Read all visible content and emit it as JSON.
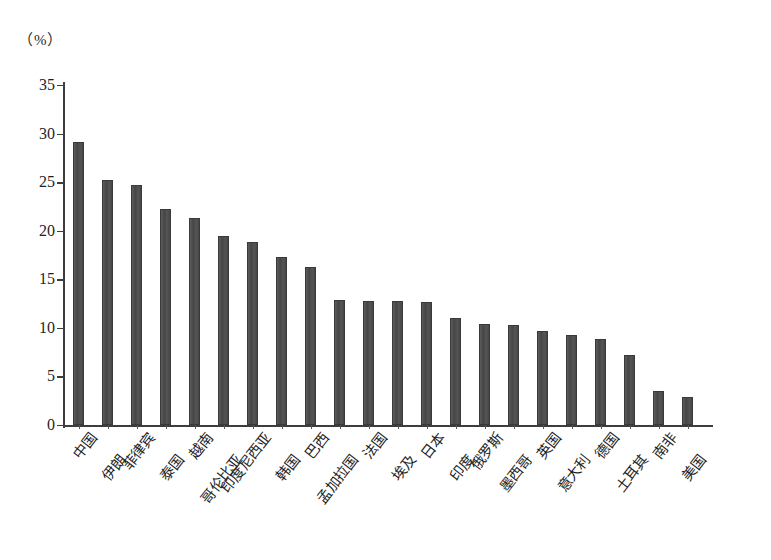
{
  "chart_data": {
    "type": "bar",
    "title": "",
    "subtitle": "",
    "unit_label": "（%）",
    "xlabel": "",
    "ylabel": "",
    "ylim": [
      0,
      35
    ],
    "y_ticks": [
      0,
      5,
      10,
      15,
      20,
      25,
      30,
      35
    ],
    "grid": false,
    "legend": false,
    "bar_color": "#4a4a4a",
    "axis_color": "#3d3d3d",
    "categories": [
      "中国",
      "伊朗",
      "菲律宾",
      "泰国",
      "越南",
      "哥伦比亚",
      "印度尼西亚",
      "韩国",
      "巴西",
      "孟加拉国",
      "法国",
      "埃及",
      "日本",
      "印度",
      "俄罗斯",
      "墨西哥",
      "英国",
      "意大利",
      "德国",
      "土耳其",
      "南非",
      "美国"
    ],
    "values": [
      29.1,
      25.2,
      24.7,
      22.2,
      21.3,
      19.5,
      18.8,
      17.3,
      16.3,
      12.9,
      12.8,
      12.8,
      12.7,
      11.0,
      10.4,
      10.3,
      9.7,
      9.3,
      8.9,
      7.2,
      3.5,
      2.9
    ]
  }
}
